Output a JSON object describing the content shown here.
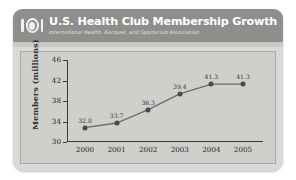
{
  "header": {
    "logo_icon": "ihrsa-ring-logo-icon",
    "title": "U.S. Health Club Membership Growth",
    "subtitle": "International Health, Racquet, and Sportsclub Association"
  },
  "colors": {
    "card_background": "#d9d9d7",
    "header_band": "#8e8e8c",
    "plot_background": "#cfcfcc",
    "line": "#6b6b6b",
    "marker": "#4a4a4a",
    "axis": "#3a3a3a",
    "title_text": "#ffffff",
    "subtitle_text": "#e2e2de"
  },
  "chart_data": {
    "type": "line",
    "title": "U.S. Health Club Membership Growth",
    "subtitle": "International Health, Racquet, and Sportsclub Association",
    "xlabel": "",
    "ylabel": "Members (millions)",
    "categories": [
      "2000",
      "2001",
      "2002",
      "2003",
      "2004",
      "2005"
    ],
    "values": [
      32.8,
      33.7,
      36.3,
      39.4,
      41.3,
      41.3
    ],
    "point_labels": [
      "32.8",
      "33.7",
      "36.3",
      "39.4",
      "41.3",
      "41.3"
    ],
    "ylim": [
      30,
      46
    ],
    "yticks": [
      30,
      34,
      38,
      42,
      46
    ],
    "ytick_labels": [
      "30",
      "34",
      "38",
      "42",
      "46"
    ],
    "grid": false,
    "legend": false,
    "markers": true
  }
}
